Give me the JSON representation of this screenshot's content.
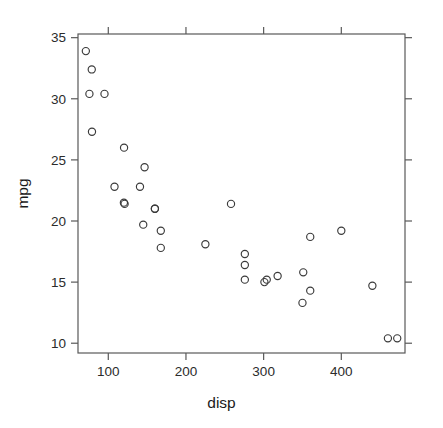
{
  "chart_data": {
    "type": "scatter",
    "title": "",
    "xlabel": "disp",
    "ylabel": "mpg",
    "xlim": [
      61.0,
      482.0
    ],
    "ylim": [
      9.2,
      35.3
    ],
    "xticks": [
      100,
      200,
      300,
      400
    ],
    "yticks": [
      10,
      15,
      20,
      25,
      30,
      35
    ],
    "xtick_labels": [
      "100",
      "200",
      "300",
      "400"
    ],
    "ytick_labels": [
      "10",
      "15",
      "20",
      "25",
      "30",
      "35"
    ],
    "grid": false,
    "legend": false,
    "marker": "open-circle",
    "marker_color": "#3a3a3a",
    "n_points": 32,
    "x": [
      160.0,
      160.0,
      108.0,
      258.0,
      360.0,
      225.0,
      360.0,
      146.7,
      140.8,
      167.6,
      167.6,
      275.8,
      275.8,
      275.8,
      472.0,
      460.0,
      440.0,
      78.7,
      75.7,
      71.1,
      120.1,
      318.0,
      304.0,
      350.0,
      400.0,
      79.0,
      120.3,
      95.1,
      351.0,
      145.0,
      301.0,
      121.0
    ],
    "y": [
      21.0,
      21.0,
      22.8,
      21.4,
      18.7,
      18.1,
      14.3,
      24.4,
      22.8,
      19.2,
      17.8,
      16.4,
      17.3,
      15.2,
      10.4,
      10.4,
      14.7,
      32.4,
      30.4,
      33.9,
      21.5,
      15.5,
      15.2,
      13.3,
      19.2,
      27.3,
      26.0,
      30.4,
      15.8,
      19.7,
      15.0,
      21.4
    ]
  },
  "axes": {
    "x_axis_name": "disp",
    "y_axis_name": "mpg"
  }
}
